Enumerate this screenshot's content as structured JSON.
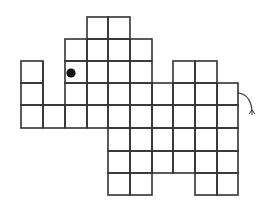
{
  "figure": {
    "title": "Elephant made of grid squares",
    "background": "#ffffff",
    "line_color": "#333333",
    "line_width": 1.6,
    "grid": {
      "x_lines": [
        21,
        43,
        65,
        87,
        108,
        130,
        152,
        173,
        195,
        217,
        238
      ],
      "y_lines": [
        17,
        39,
        61,
        83,
        105,
        128,
        151,
        173,
        195
      ]
    },
    "rows": [
      {
        "row": 0,
        "cols": [
          3,
          4
        ]
      },
      {
        "row": 1,
        "cols": [
          2,
          3,
          4,
          5
        ]
      },
      {
        "row": 2,
        "cols": [
          0,
          2,
          3,
          4,
          5,
          7,
          8
        ]
      },
      {
        "row": 3,
        "cols": [
          0,
          2,
          3,
          4,
          5,
          6,
          7,
          8,
          9
        ]
      },
      {
        "row": 4,
        "cols": [
          0,
          1,
          2,
          3,
          4,
          5,
          6,
          7,
          8,
          9
        ]
      },
      {
        "row": 5,
        "cols": [
          4,
          5,
          6,
          7,
          8,
          9
        ]
      },
      {
        "row": 6,
        "cols": [
          4,
          5,
          6,
          7,
          8,
          9
        ]
      },
      {
        "row": 7,
        "cols": [
          4,
          5,
          8,
          9
        ]
      }
    ],
    "open_gap": {
      "description": "gap between trunk and head, open at top",
      "segments": [
        [
          43,
          61,
          43,
          105
        ],
        [
          43,
          105,
          65,
          105
        ]
      ]
    },
    "merged_edges": {
      "description": "missing interior divider in row 6 between cols 6 and 7",
      "hidden_segments": []
    },
    "eye": {
      "cx": 71,
      "cy": 73,
      "r": 4.6,
      "color": "#111111"
    },
    "tail": {
      "path": "M238 93 Q250 94 252 110",
      "tuft": [
        [
          252,
          110,
          249,
          114
        ],
        [
          252,
          110,
          252,
          115
        ],
        [
          252,
          110,
          255,
          114
        ]
      ]
    }
  }
}
